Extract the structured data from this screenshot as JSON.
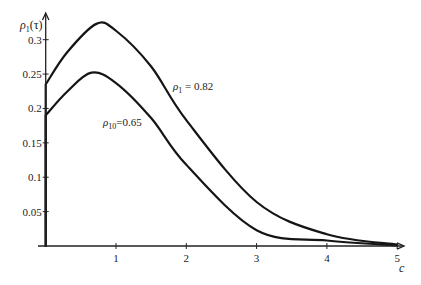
{
  "chart_data": {
    "type": "line",
    "title": "",
    "xlabel": "c",
    "ylabel": "ρ1(τ)",
    "xlim": [
      0,
      5
    ],
    "ylim": [
      0,
      0.33
    ],
    "grid": false,
    "legend": "none (inline annotations)",
    "x_ticks": [
      "1",
      "2",
      "3",
      "4",
      "5"
    ],
    "y_ticks": [
      "0.05",
      "0.1",
      "0.15",
      "0.2",
      "0.25",
      "0.3"
    ],
    "series": [
      {
        "name": "ρ1 = 0.82",
        "x": [
          0,
          0.3,
          0.72,
          1,
          1.5,
          2,
          3,
          4,
          5
        ],
        "values": [
          0.235,
          0.281,
          0.323,
          0.313,
          0.261,
          0.183,
          0.064,
          0.017,
          0.002
        ]
      },
      {
        "name": "ρ10 = 0.65",
        "x": [
          0,
          0.3,
          0.65,
          1,
          1.5,
          2,
          3,
          4,
          5
        ],
        "values": [
          0.19,
          0.224,
          0.252,
          0.237,
          0.186,
          0.118,
          0.023,
          0.008,
          0.001
        ]
      }
    ],
    "annotations": [
      {
        "text_main": "ρ",
        "sub": "1",
        "rest": " = 0.82",
        "at_x": 1.8,
        "at_y": 0.23
      },
      {
        "text_main": "ρ",
        "sub": "10",
        "rest": "=0.65",
        "at_x": 0.82,
        "at_y": 0.178
      }
    ]
  },
  "labels": {
    "y_axis_main": "ρ",
    "y_axis_sub": "1",
    "y_axis_rest": "(τ)",
    "x_axis": "c",
    "annot1_main": "ρ",
    "annot1_sub": "1",
    "annot1_rest": " = 0.82",
    "annot2_main": "ρ",
    "annot2_sub": "10",
    "annot2_rest": "=0.65"
  }
}
